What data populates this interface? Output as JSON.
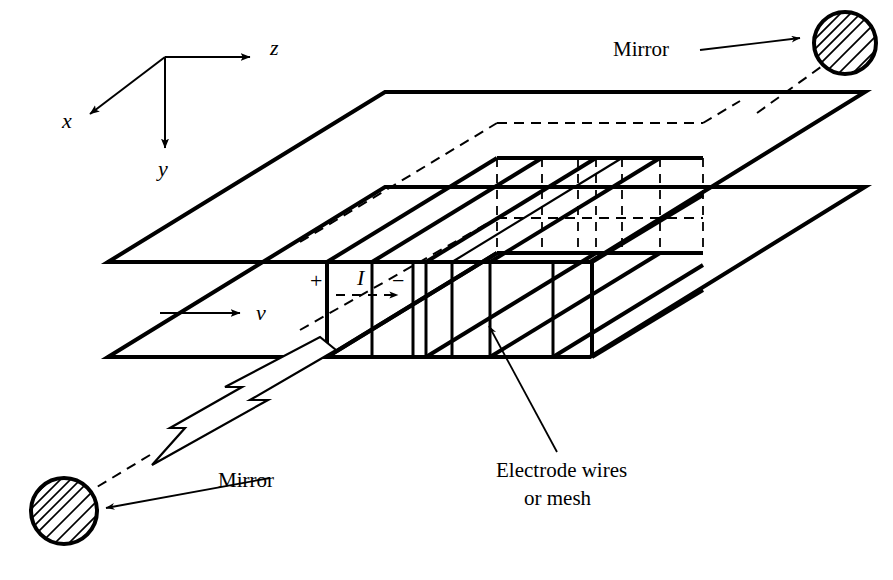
{
  "figure": {
    "background_color": "#ffffff",
    "line_color": "#000000",
    "width": 893,
    "height": 580
  },
  "axes": {
    "z_label": "z",
    "x_label": "x",
    "y_label": "y",
    "origin": {
      "x": 165,
      "y": 57
    }
  },
  "labels": {
    "mirror_top": "Mirror",
    "mirror_bottom": "Mirror",
    "electrode_line1": "Electrode wires",
    "electrode_line2": "or mesh",
    "current": "I",
    "plus": "+",
    "minus": "−",
    "velocity": "v"
  },
  "elements": {
    "mirror_top_right": {
      "cx": 845,
      "cy": 43,
      "r": 33,
      "hatched": true
    },
    "mirror_bottom_left": {
      "cx": 64,
      "cy": 511,
      "r": 35,
      "hatched": true
    },
    "beam_arrow_direction": "down-left",
    "electrode_count_front": 6,
    "plate_count": 2
  },
  "icons": {
    "arrow_z": "arrowhead-right-icon",
    "arrow_x": "arrowhead-downleft-icon",
    "arrow_y": "arrowhead-down-icon",
    "arrow_v": "arrowhead-right-icon",
    "arrow_I": "arrowhead-right-icon",
    "beam": "hollow-beam-arrow-icon",
    "mirror": "hatched-circle-icon"
  }
}
